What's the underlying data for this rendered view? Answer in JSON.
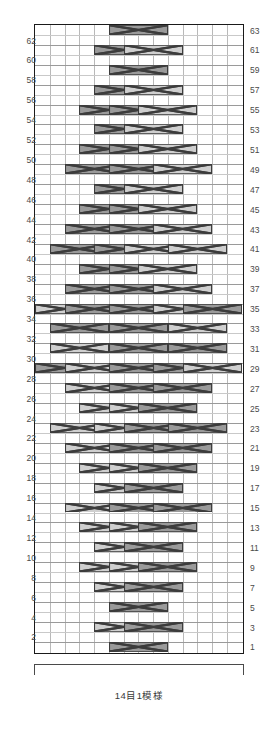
{
  "chart": {
    "kind": "japanese-knitting-cable-chart",
    "columns": 14,
    "rows": 63,
    "caption": "14目1模様",
    "caption_meaning": "14 stitches 1 pattern",
    "colors": {
      "cable_dark": "#9a9a9a",
      "cable_light": "#cfcfcf",
      "symbol_stroke": "#3c3c3c",
      "grid_line": "#b9b9b9",
      "frame": "#1a1a1a",
      "label_text": "#4a4a4a"
    },
    "row_labels_left": [
      62,
      60,
      58,
      56,
      54,
      52,
      50,
      48,
      46,
      44,
      42,
      40,
      38,
      36,
      34,
      32,
      30,
      28,
      26,
      24,
      22,
      20,
      18,
      16,
      14,
      12,
      10,
      8,
      6,
      4,
      2
    ],
    "row_labels_right": [
      63,
      61,
      59,
      57,
      55,
      53,
      51,
      49,
      47,
      45,
      43,
      41,
      39,
      37,
      35,
      33,
      31,
      29,
      27,
      25,
      23,
      21,
      19,
      17,
      15,
      13,
      11,
      9,
      7,
      5,
      3,
      1
    ],
    "legend": {
      "dark": "right-crossing cable (2 over 2)",
      "light": "left-crossing cable (2 over 2)"
    },
    "cables": [
      {
        "row": 63,
        "col": 5,
        "type": "dark"
      },
      {
        "row": 61,
        "col": 4,
        "type": "dark"
      },
      {
        "row": 61,
        "col": 6,
        "type": "light"
      },
      {
        "row": 59,
        "col": 5,
        "type": "dark"
      },
      {
        "row": 57,
        "col": 4,
        "type": "dark"
      },
      {
        "row": 57,
        "col": 6,
        "type": "light"
      },
      {
        "row": 55,
        "col": 3,
        "type": "dark"
      },
      {
        "row": 55,
        "col": 5,
        "type": "dark"
      },
      {
        "row": 55,
        "col": 7,
        "type": "light"
      },
      {
        "row": 53,
        "col": 4,
        "type": "dark"
      },
      {
        "row": 53,
        "col": 6,
        "type": "light"
      },
      {
        "row": 51,
        "col": 3,
        "type": "dark"
      },
      {
        "row": 51,
        "col": 5,
        "type": "dark"
      },
      {
        "row": 51,
        "col": 7,
        "type": "light"
      },
      {
        "row": 49,
        "col": 2,
        "type": "dark"
      },
      {
        "row": 49,
        "col": 5,
        "type": "dark"
      },
      {
        "row": 49,
        "col": 8,
        "type": "light"
      },
      {
        "row": 47,
        "col": 4,
        "type": "dark"
      },
      {
        "row": 47,
        "col": 6,
        "type": "light"
      },
      {
        "row": 45,
        "col": 3,
        "type": "dark"
      },
      {
        "row": 45,
        "col": 5,
        "type": "dark"
      },
      {
        "row": 45,
        "col": 7,
        "type": "light"
      },
      {
        "row": 43,
        "col": 2,
        "type": "dark"
      },
      {
        "row": 43,
        "col": 5,
        "type": "dark"
      },
      {
        "row": 43,
        "col": 8,
        "type": "light"
      },
      {
        "row": 41,
        "col": 1,
        "type": "dark"
      },
      {
        "row": 41,
        "col": 4,
        "type": "dark"
      },
      {
        "row": 41,
        "col": 6,
        "type": "light"
      },
      {
        "row": 41,
        "col": 9,
        "type": "light"
      },
      {
        "row": 39,
        "col": 3,
        "type": "dark"
      },
      {
        "row": 39,
        "col": 5,
        "type": "dark"
      },
      {
        "row": 39,
        "col": 7,
        "type": "light"
      },
      {
        "row": 37,
        "col": 2,
        "type": "dark"
      },
      {
        "row": 37,
        "col": 5,
        "type": "dark"
      },
      {
        "row": 37,
        "col": 8,
        "type": "light"
      },
      {
        "row": 35,
        "col": 0,
        "type": "light"
      },
      {
        "row": 35,
        "col": 2,
        "type": "dark"
      },
      {
        "row": 35,
        "col": 5,
        "type": "dark"
      },
      {
        "row": 35,
        "col": 8,
        "type": "light"
      },
      {
        "row": 35,
        "col": 10,
        "type": "dark"
      },
      {
        "row": 33,
        "col": 1,
        "type": "dark"
      },
      {
        "row": 33,
        "col": 5,
        "type": "dark"
      },
      {
        "row": 33,
        "col": 9,
        "type": "light"
      },
      {
        "row": 31,
        "col": 1,
        "type": "light"
      },
      {
        "row": 31,
        "col": 5,
        "type": "dark"
      },
      {
        "row": 31,
        "col": 9,
        "type": "dark"
      },
      {
        "row": 29,
        "col": 0,
        "type": "dark"
      },
      {
        "row": 29,
        "col": 2,
        "type": "light"
      },
      {
        "row": 29,
        "col": 5,
        "type": "dark"
      },
      {
        "row": 29,
        "col": 8,
        "type": "dark"
      },
      {
        "row": 29,
        "col": 10,
        "type": "light"
      },
      {
        "row": 27,
        "col": 2,
        "type": "light"
      },
      {
        "row": 27,
        "col": 5,
        "type": "dark"
      },
      {
        "row": 27,
        "col": 8,
        "type": "dark"
      },
      {
        "row": 25,
        "col": 3,
        "type": "light"
      },
      {
        "row": 25,
        "col": 5,
        "type": "light"
      },
      {
        "row": 25,
        "col": 7,
        "type": "dark"
      },
      {
        "row": 23,
        "col": 1,
        "type": "light"
      },
      {
        "row": 23,
        "col": 4,
        "type": "light"
      },
      {
        "row": 23,
        "col": 6,
        "type": "dark"
      },
      {
        "row": 23,
        "col": 9,
        "type": "dark"
      },
      {
        "row": 21,
        "col": 2,
        "type": "light"
      },
      {
        "row": 21,
        "col": 5,
        "type": "dark"
      },
      {
        "row": 21,
        "col": 8,
        "type": "dark"
      },
      {
        "row": 19,
        "col": 3,
        "type": "light"
      },
      {
        "row": 19,
        "col": 5,
        "type": "light"
      },
      {
        "row": 19,
        "col": 7,
        "type": "dark"
      },
      {
        "row": 17,
        "col": 4,
        "type": "light"
      },
      {
        "row": 17,
        "col": 6,
        "type": "dark"
      },
      {
        "row": 15,
        "col": 2,
        "type": "light"
      },
      {
        "row": 15,
        "col": 5,
        "type": "dark"
      },
      {
        "row": 15,
        "col": 8,
        "type": "dark"
      },
      {
        "row": 13,
        "col": 3,
        "type": "light"
      },
      {
        "row": 13,
        "col": 5,
        "type": "light"
      },
      {
        "row": 13,
        "col": 7,
        "type": "dark"
      },
      {
        "row": 11,
        "col": 4,
        "type": "light"
      },
      {
        "row": 11,
        "col": 6,
        "type": "dark"
      },
      {
        "row": 9,
        "col": 3,
        "type": "light"
      },
      {
        "row": 9,
        "col": 5,
        "type": "light"
      },
      {
        "row": 9,
        "col": 7,
        "type": "dark"
      },
      {
        "row": 7,
        "col": 4,
        "type": "light"
      },
      {
        "row": 7,
        "col": 6,
        "type": "dark"
      },
      {
        "row": 5,
        "col": 5,
        "type": "dark"
      },
      {
        "row": 3,
        "col": 4,
        "type": "light"
      },
      {
        "row": 3,
        "col": 6,
        "type": "dark"
      },
      {
        "row": 1,
        "col": 5,
        "type": "dark"
      }
    ]
  }
}
